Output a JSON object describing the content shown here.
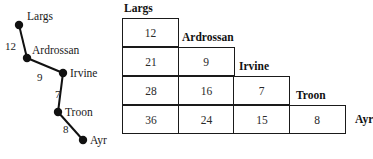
{
  "diagram": {
    "nodes": [
      {
        "id": "largs",
        "label": "Largs",
        "x": 19,
        "y": 25,
        "label_x": 27,
        "label_y": 11
      },
      {
        "id": "ardrossan",
        "label": "Ardrossan",
        "x": 27,
        "y": 58,
        "label_x": 32,
        "label_y": 45
      },
      {
        "id": "irvine",
        "label": "Irvine",
        "x": 63,
        "y": 73,
        "label_x": 70,
        "label_y": 68
      },
      {
        "id": "troon",
        "label": "Troon",
        "x": 58,
        "y": 112,
        "label_x": 65,
        "label_y": 107
      },
      {
        "id": "ayr",
        "label": "Ayr",
        "x": 83,
        "y": 140,
        "label_x": 90,
        "label_y": 135
      }
    ],
    "edges": [
      {
        "from": "largs",
        "to": "ardrossan",
        "weight": "12",
        "label_x": 5,
        "label_y": 41
      },
      {
        "from": "ardrossan",
        "to": "irvine",
        "weight": "9",
        "label_x": 37,
        "label_y": 72
      },
      {
        "from": "irvine",
        "to": "troon",
        "weight": "7",
        "label_x": 55,
        "label_y": 89
      },
      {
        "from": "troon",
        "to": "ayr",
        "weight": "8",
        "label_x": 63,
        "label_y": 124
      }
    ],
    "node_radius": 4,
    "edge_color": "#111111",
    "node_color": "#111111"
  },
  "matrix": {
    "type": "staircase-distance-matrix",
    "column_headers": [
      "Largs",
      "Ardrossan",
      "Irvine",
      "Troon"
    ],
    "row_header": "Ayr",
    "headers": [
      {
        "label": "Largs",
        "x": 2,
        "y": 3
      },
      {
        "label": "Ardrossan",
        "x": 60,
        "y": 32
      },
      {
        "label": "Irvine",
        "x": 117,
        "y": 61
      },
      {
        "label": "Troon",
        "x": 174,
        "y": 90
      },
      {
        "label": "Ayr",
        "x": 233,
        "y": 120
      }
    ],
    "rows": [
      {
        "top": 18,
        "values": [
          "12"
        ]
      },
      {
        "top": 47,
        "values": [
          "21",
          "9"
        ]
      },
      {
        "top": 76,
        "values": [
          "28",
          "16",
          "7"
        ]
      },
      {
        "top": 105,
        "values": [
          "36",
          "24",
          "15",
          "8"
        ]
      }
    ]
  }
}
